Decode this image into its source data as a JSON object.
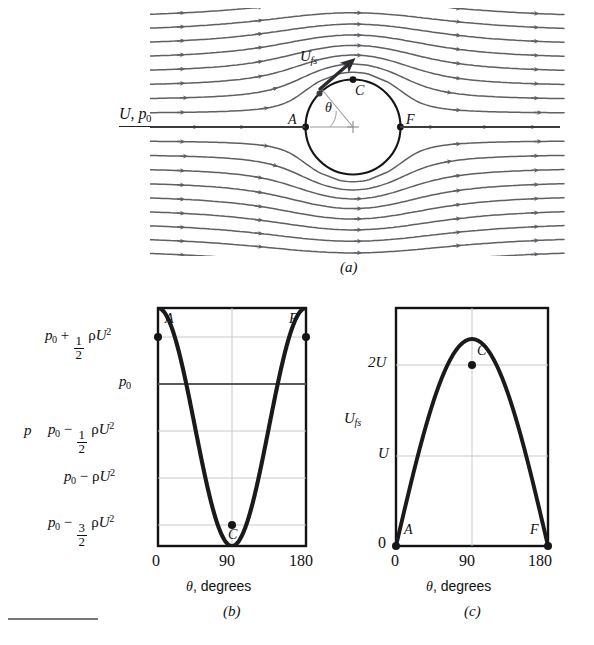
{
  "figure": {
    "panels": [
      {
        "id": "a",
        "caption": "(a)"
      },
      {
        "id": "b",
        "caption": "(b)"
      },
      {
        "id": "c",
        "caption": "(c)"
      }
    ]
  },
  "panel_a": {
    "inflow_label_U": "U",
    "inflow_label_comma": ",",
    "inflow_label_p": "p",
    "inflow_label_p_sub": "0",
    "velocity_label_U": "U",
    "velocity_label_sub": "fs",
    "point_A": "A",
    "point_C": "C",
    "point_F": "F",
    "angle_symbol": "θ",
    "cylinder_color": "#1a1a1a",
    "streamline_color": "#5f5f64",
    "arrow_color": "#5f5f64"
  },
  "panel_b": {
    "y_axis_name": "p",
    "x_axis_name_symbol": "θ",
    "x_axis_name_text": ", degrees",
    "x_ticks": [
      "0",
      "90",
      "180"
    ],
    "y_labels": [
      {
        "lead": "p",
        "lead_sub": "0",
        "op": "+",
        "frac_num": "1",
        "frac_den": "2",
        "rho": "ρ",
        "U": "U",
        "pow": "2"
      },
      {
        "lead": "p",
        "lead_sub": "0",
        "op": "",
        "frac_num": "",
        "frac_den": "",
        "rho": "",
        "U": "",
        "pow": ""
      },
      {
        "lead": "p",
        "lead_sub": "0",
        "op": "−",
        "frac_num": "1",
        "frac_den": "2",
        "rho": "ρ",
        "U": "U",
        "pow": "2"
      },
      {
        "lead": "p",
        "lead_sub": "0",
        "op": "−",
        "frac_num": "",
        "frac_den": "",
        "rho": "ρ",
        "U": "U",
        "pow": "2"
      },
      {
        "lead": "p",
        "lead_sub": "0",
        "op": "−",
        "frac_num": "3",
        "frac_den": "2",
        "rho": "ρ",
        "U": "U",
        "pow": "2"
      }
    ],
    "point_A": "A",
    "point_C": "C",
    "point_F": "F",
    "curve_color": "#1a1a1a",
    "grid_color": "#c9c9c9",
    "p0_line_color": "#5a5a5a"
  },
  "panel_c": {
    "y_axis_name_U": "U",
    "y_axis_name_sub": "fs",
    "x_axis_name_symbol": "θ",
    "x_axis_name_text": ", degrees",
    "x_ticks": [
      "0",
      "90",
      "180"
    ],
    "y_ticks": [
      "2U",
      "U",
      "0"
    ],
    "point_A": "A",
    "point_C": "C",
    "point_F": "F",
    "curve_color": "#1a1a1a",
    "grid_color": "#c9c9c9"
  },
  "chart_data": [
    {
      "type": "line",
      "panel": "b",
      "title": "Surface pressure distribution on a cylinder",
      "xlabel": "θ, degrees",
      "ylabel": "p",
      "xlim": [
        0,
        180
      ],
      "ylim": [
        -1.5,
        0.5
      ],
      "xticks": [
        0,
        90,
        180
      ],
      "yticks": [
        0.5,
        0.0,
        -0.5,
        -1.0,
        -1.5
      ],
      "yticklabels": [
        "p0 + 1/2 rho U^2",
        "p0",
        "p0 - 1/2 rho U^2",
        "p0 - rho U^2",
        "p0 - 3/2 rho U^2"
      ],
      "grid": true,
      "legend": "none",
      "equation": "p = p0 + 1/2 rho U^2 (1 - 4 sin^2(theta))",
      "x": [
        0,
        10,
        20,
        30,
        40,
        50,
        60,
        70,
        80,
        90,
        100,
        110,
        120,
        130,
        140,
        150,
        160,
        170,
        180
      ],
      "values": [
        0.5,
        0.44,
        0.28,
        0.0,
        -0.33,
        -0.67,
        -1.0,
        -1.27,
        -1.44,
        -1.5,
        -1.44,
        -1.27,
        -1.0,
        -0.67,
        -0.33,
        0.0,
        0.28,
        0.44,
        0.5
      ],
      "annotations": [
        {
          "label": "A",
          "x": 0,
          "y": 0.5
        },
        {
          "label": "C",
          "x": 90,
          "y": -1.5
        },
        {
          "label": "F",
          "x": 180,
          "y": 0.5
        }
      ]
    },
    {
      "type": "line",
      "panel": "c",
      "title": "Surface velocity distribution on a cylinder",
      "xlabel": "θ, degrees",
      "ylabel": "U_fs",
      "xlim": [
        0,
        180
      ],
      "ylim": [
        0,
        2.3
      ],
      "xticks": [
        0,
        90,
        180
      ],
      "yticks": [
        0,
        1,
        2
      ],
      "yticklabels": [
        "0",
        "U",
        "2U"
      ],
      "grid": true,
      "legend": "none",
      "equation": "U_fs = 2 U sin(theta)",
      "x": [
        0,
        10,
        20,
        30,
        40,
        50,
        60,
        70,
        80,
        90,
        100,
        110,
        120,
        130,
        140,
        150,
        160,
        170,
        180
      ],
      "values": [
        0,
        0.347,
        0.684,
        1.0,
        1.286,
        1.532,
        1.732,
        1.879,
        1.97,
        2.0,
        1.97,
        1.879,
        1.732,
        1.532,
        1.286,
        1.0,
        0.684,
        0.347,
        0
      ],
      "annotations": [
        {
          "label": "A",
          "x": 0,
          "y": 0
        },
        {
          "label": "C",
          "x": 90,
          "y": 2.0
        },
        {
          "label": "F",
          "x": 180,
          "y": 0
        }
      ]
    }
  ],
  "footer": {
    "rule": ""
  }
}
